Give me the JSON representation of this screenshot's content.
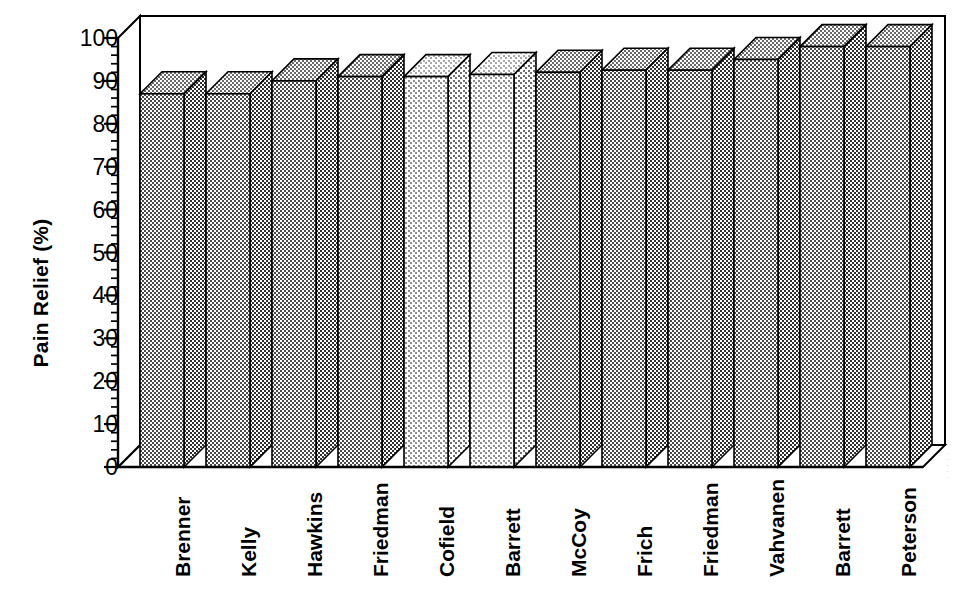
{
  "chart_data": {
    "type": "bar",
    "title": "",
    "subtitle": "",
    "xlabel": "",
    "ylabel": "Pain Relief (%)",
    "categories": [
      "Brenner",
      "Kelly",
      "Hawkins",
      "Friedman",
      "Cofield",
      "Barrett",
      "McCoy",
      "Frich",
      "Friedman",
      "Vahvanen",
      "Barrett",
      "Peterson"
    ],
    "values": [
      87,
      87,
      90,
      91,
      91,
      91.5,
      92,
      92.5,
      92.5,
      95,
      98,
      98
    ],
    "ylim": [
      0,
      100
    ],
    "yticks": [
      0,
      10,
      20,
      30,
      40,
      50,
      60,
      70,
      80,
      90,
      100
    ],
    "ytick_labels": [
      "0",
      "10",
      "20",
      "30",
      "40",
      "50",
      "60",
      "70",
      "80",
      "90",
      "100"
    ],
    "minor_tick_interval": 2,
    "grid": false,
    "legend": null,
    "style": "3d-bar",
    "bar_fill_light": [
      "Cofield",
      "Barrett"
    ]
  },
  "axis": {
    "y_title": "Pain Relief (%)"
  },
  "edge_artifact": {
    "text": "·····"
  }
}
